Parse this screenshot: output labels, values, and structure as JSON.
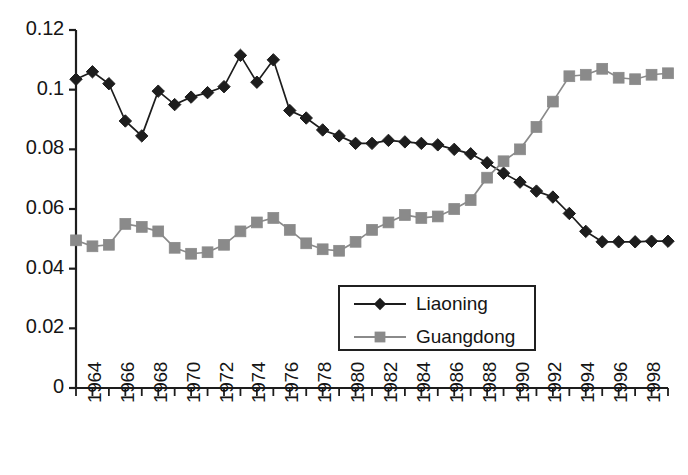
{
  "chart_data": {
    "type": "line",
    "title": "",
    "subtitle": "",
    "xlabel": "",
    "ylabel": "",
    "grid": false,
    "legend_position": "inside-center-lower",
    "xlim": [
      1964,
      2000
    ],
    "ylim": [
      0,
      0.12
    ],
    "ytick_values": [
      0,
      0.02,
      0.04,
      0.06,
      0.08,
      0.1,
      0.12
    ],
    "ytick_labels": [
      "0",
      "0.02",
      "0.04",
      "0.06",
      "0.08",
      "0.1",
      "0.12"
    ],
    "x": [
      1964,
      1965,
      1966,
      1967,
      1968,
      1969,
      1970,
      1971,
      1972,
      1973,
      1974,
      1975,
      1976,
      1977,
      1978,
      1979,
      1980,
      1981,
      1982,
      1983,
      1984,
      1985,
      1986,
      1987,
      1988,
      1989,
      1990,
      1991,
      1992,
      1993,
      1994,
      1995,
      1996,
      1997,
      1998,
      1999,
      2000
    ],
    "xtick_labels": [
      "1964",
      "1966",
      "1968",
      "1970",
      "1972",
      "1974",
      "1976",
      "1978",
      "1980",
      "1982",
      "1984",
      "1986",
      "1988",
      "1990",
      "1992",
      "1994",
      "1996",
      "1998"
    ],
    "xtick_values": [
      1964,
      1966,
      1968,
      1970,
      1972,
      1974,
      1976,
      1978,
      1980,
      1982,
      1984,
      1986,
      1988,
      1990,
      1992,
      1994,
      1996,
      1998
    ],
    "series": [
      {
        "name": "Liaoning",
        "color": "#1d1d1d",
        "marker": "diamond",
        "values": [
          0.1035,
          0.106,
          0.102,
          0.0895,
          0.0845,
          0.0995,
          0.095,
          0.0975,
          0.099,
          0.101,
          0.1115,
          0.1025,
          0.11,
          0.093,
          0.0905,
          0.0865,
          0.0845,
          0.082,
          0.082,
          0.083,
          0.0825,
          0.082,
          0.0815,
          0.08,
          0.0785,
          0.0755,
          0.072,
          0.069,
          0.066,
          0.064,
          0.0585,
          0.0525,
          0.049,
          0.049,
          0.049,
          0.0492,
          0.0492
        ]
      },
      {
        "name": "Guangdong",
        "color": "#8a8a8a",
        "marker": "square",
        "values": [
          0.0495,
          0.0475,
          0.048,
          0.055,
          0.054,
          0.0525,
          0.047,
          0.045,
          0.0455,
          0.048,
          0.0525,
          0.0555,
          0.057,
          0.053,
          0.0485,
          0.0465,
          0.046,
          0.049,
          0.053,
          0.0555,
          0.058,
          0.057,
          0.0575,
          0.06,
          0.063,
          0.0705,
          0.076,
          0.08,
          0.0875,
          0.096,
          0.1045,
          0.105,
          0.107,
          0.104,
          0.1035,
          0.105,
          0.1055
        ]
      }
    ]
  },
  "legend": {
    "items": [
      {
        "label": "Liaoning",
        "color": "#1d1d1d",
        "marker": "diamond"
      },
      {
        "label": "Guangdong",
        "color": "#8a8a8a",
        "marker": "square"
      }
    ]
  },
  "axes": {
    "axis_color": "#1d1d1d"
  }
}
